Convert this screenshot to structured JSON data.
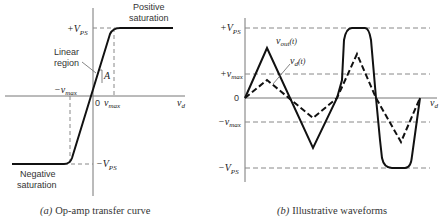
{
  "panel_a": {
    "caption_prefix": "(a)",
    "caption": "Op-amp transfer curve",
    "labels": {
      "pos_vps": "+V",
      "neg_vps": "−V",
      "vps_sub": "PS",
      "neg_vmax": "−v",
      "vmax": "v",
      "max_sub": "max",
      "zero": "0",
      "vd": "v",
      "vd_sub": "d",
      "gain": "A",
      "linear_region_1": "Linear",
      "linear_region_2": "region",
      "pos_sat_1": "Positive",
      "pos_sat_2": "saturation",
      "neg_sat_1": "Negative",
      "neg_sat_2": "saturation"
    }
  },
  "panel_b": {
    "caption_prefix": "(b)",
    "caption": "Illustrative waveforms",
    "labels": {
      "pos_vps": "+V",
      "neg_vps": "−V",
      "vps_sub": "PS",
      "pos_vmax": "+v",
      "neg_vmax": "−v",
      "max_sub": "max",
      "zero": "0",
      "vout": "v",
      "vout_sub": "out",
      "vout_arg": "(t)",
      "vd": "v",
      "vd_sub": "d",
      "vd_arg": "(t)",
      "axis": "v",
      "axis_sub": "d"
    },
    "series": [
      {
        "name": "v_out(t)",
        "style": "solid"
      },
      {
        "name": "v_d(t)",
        "style": "dashed"
      }
    ]
  }
}
